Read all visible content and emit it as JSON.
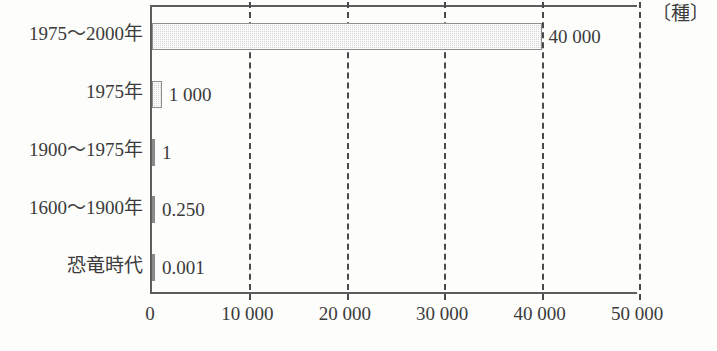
{
  "chart_data": {
    "type": "bar",
    "orientation": "horizontal",
    "title": "",
    "subtitle": "",
    "xlabel": "",
    "ylabel": "",
    "unit_label": "〔種〕",
    "xlim": [
      0,
      50000
    ],
    "xticks": [
      0,
      10000,
      20000,
      30000,
      40000,
      50000
    ],
    "xtick_labels": [
      "0",
      "10 000",
      "20 000",
      "30 000",
      "40 000",
      "50 000"
    ],
    "grid": "vertical-dashed",
    "legend": "none",
    "categories": [
      "1975〜2000年",
      "1975年",
      "1900〜1975年",
      "1600〜1900年",
      "恐竜時代"
    ],
    "values": [
      40000,
      1000,
      1,
      0.25,
      0.001
    ],
    "value_labels": [
      "40 000",
      "1 000",
      "1",
      "0.250",
      "0.001"
    ],
    "bars": [
      {
        "category": "1975〜2000年",
        "value": 40000,
        "value_label": "40 000"
      },
      {
        "category": "1975年",
        "value": 1000,
        "value_label": "1 000"
      },
      {
        "category": "1900〜1975年",
        "value": 1,
        "value_label": "1"
      },
      {
        "category": "1600〜1900年",
        "value": 0.25,
        "value_label": "0.250"
      },
      {
        "category": "恐竜時代",
        "value": 0.001,
        "value_label": "0.001"
      }
    ],
    "colors": {
      "bar_fill": "#d8d8d8",
      "bar_stroke": "#8e8e8e",
      "axis": "#5d5d5d",
      "gridline": "#4a4a4a",
      "text": "#3b3b3b",
      "background": "#fdfdfb"
    }
  }
}
